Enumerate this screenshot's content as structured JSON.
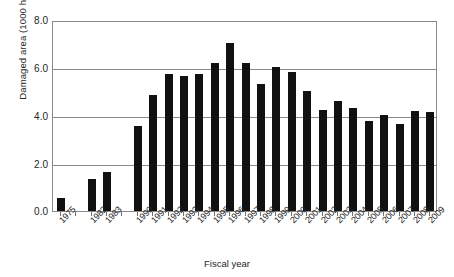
{
  "chart_data": {
    "type": "bar",
    "title": "",
    "xlabel": "Fiscal year",
    "ylabel": "Damaged area (1000 ha)",
    "ylim": [
      0.0,
      8.0
    ],
    "ytick_labels": [
      "0.0",
      "2.0",
      "4.0",
      "6.0",
      "8.0"
    ],
    "ytick_values": [
      0.0,
      2.0,
      4.0,
      6.0,
      8.0
    ],
    "grid": true,
    "legend": null,
    "categories": [
      "1975",
      "1982",
      "1983",
      "1990",
      "1991",
      "1992",
      "1993",
      "1994",
      "1995",
      "1996",
      "1997",
      "1998",
      "1999",
      "2000",
      "2001",
      "2002",
      "2003",
      "2004",
      "2005",
      "2006",
      "2007",
      "2008",
      "2009"
    ],
    "values": [
      0.54,
      1.33,
      1.63,
      3.6,
      4.87,
      5.77,
      5.67,
      5.78,
      6.25,
      7.08,
      6.25,
      5.35,
      6.07,
      5.85,
      5.05,
      4.25,
      4.63,
      4.33,
      3.8,
      4.05,
      3.65,
      4.22,
      4.18
    ],
    "slot_gaps_after": [
      "1975",
      "1983"
    ]
  },
  "axis": {
    "y_title": "Damaged area (1000 ha)",
    "x_title": "Fiscal year"
  }
}
